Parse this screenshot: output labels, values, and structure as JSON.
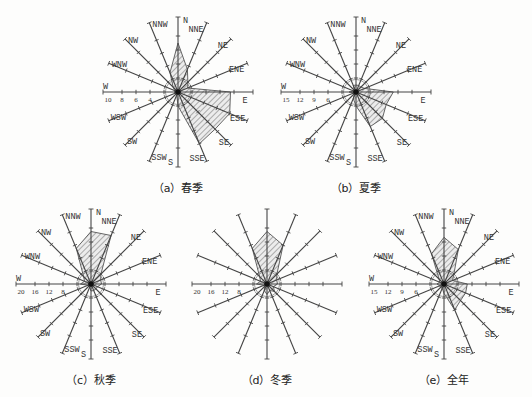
{
  "directions": [
    "N",
    "NNE",
    "NE",
    "ENE",
    "E",
    "ESE",
    "SE",
    "SSE",
    "S",
    "SSW",
    "SW",
    "WSW",
    "W",
    "WNW",
    "NW",
    "NNW"
  ],
  "chart_data": [
    {
      "type": "radar",
      "id": "a",
      "caption": "（a）春季",
      "title": "春季",
      "center": [
        178,
        92
      ],
      "radius": 75,
      "scale_max": 10,
      "tick_step": 2,
      "tick_labels": [
        "10",
        "8",
        "6",
        "4"
      ],
      "show_direction_labels": true,
      "values": [
        7,
        3.5,
        2,
        1.5,
        7.5,
        8,
        7.5,
        8,
        2,
        0.5,
        0.5,
        0.5,
        0.5,
        0.5,
        1,
        3
      ]
    },
    {
      "type": "radar",
      "id": "b",
      "caption": "（b）夏季",
      "title": "夏季",
      "center": [
        356,
        92
      ],
      "radius": 75,
      "scale_max": 15,
      "tick_step": 3,
      "tick_labels": [
        "15",
        "12",
        "9",
        "6"
      ],
      "show_direction_labels": true,
      "values": [
        1.5,
        1.5,
        1.5,
        2,
        8,
        7,
        8,
        8,
        3,
        1.5,
        0.5,
        0.5,
        1.5,
        0.5,
        0.5,
        1.5
      ]
    },
    {
      "type": "radar",
      "id": "c",
      "caption": "（c）秋季",
      "title": "秋季",
      "center": [
        91,
        284
      ],
      "radius": 75,
      "scale_max": 20,
      "tick_step": 4,
      "tick_labels": [
        "20",
        "16",
        "12",
        "8"
      ],
      "show_direction_labels": true,
      "values": [
        15,
        15,
        4,
        3,
        3,
        2,
        2,
        2,
        2,
        1,
        1,
        1,
        3,
        2,
        3,
        11
      ]
    },
    {
      "type": "radar",
      "id": "d",
      "caption": "（d）冬季",
      "title": "冬季",
      "center": [
        267,
        284
      ],
      "radius": 75,
      "scale_max": 20,
      "tick_step": 4,
      "tick_labels": [
        "20",
        "16",
        "12",
        "8"
      ],
      "show_direction_labels": false,
      "values": [
        15,
        12,
        4,
        3,
        3,
        2,
        3,
        2,
        3,
        2,
        1,
        1,
        3,
        2,
        3,
        11
      ]
    },
    {
      "type": "radar",
      "id": "e",
      "caption": "（e）全年",
      "title": "全年",
      "center": [
        444,
        284
      ],
      "radius": 75,
      "scale_max": 15,
      "tick_step": 3,
      "tick_labels": [
        "15",
        "12",
        "9",
        "6"
      ],
      "show_direction_labels": true,
      "values": [
        10,
        8,
        3,
        2,
        5,
        5,
        5,
        6,
        2,
        1,
        1,
        1,
        1.5,
        1,
        1.5,
        7
      ]
    }
  ]
}
